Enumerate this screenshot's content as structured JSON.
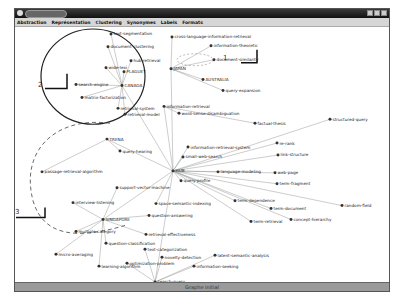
{
  "window": {
    "title": "",
    "controls": [
      "minimize",
      "maximize",
      "close"
    ]
  },
  "menu": {
    "items": [
      {
        "label": "Abstraction"
      },
      {
        "label": "Représentation"
      },
      {
        "label": "Clustering"
      },
      {
        "label": "Synonymes"
      },
      {
        "label": "Labels"
      },
      {
        "label": "Formats"
      }
    ]
  },
  "annotations": {
    "region1": "1",
    "region2": "2",
    "region3": "3"
  },
  "graph": {
    "nodes": [
      {
        "id": "text-segmentation",
        "x": 96,
        "y": 7
      },
      {
        "id": "document-clustering",
        "x": 93,
        "y": 20
      },
      {
        "id": "hub-retrieval",
        "x": 116,
        "y": 34
      },
      {
        "id": "cross-language-information-retrieval",
        "x": 157,
        "y": 10
      },
      {
        "id": "information-theoretic",
        "x": 196,
        "y": 19
      },
      {
        "id": "document-similarity",
        "x": 199,
        "y": 33
      },
      {
        "id": "JAPAN",
        "x": 156,
        "y": 42
      },
      {
        "id": "AUSTRALIA",
        "x": 188,
        "y": 53
      },
      {
        "id": "query-expansion",
        "x": 208,
        "y": 64
      },
      {
        "id": "wide-lexi",
        "x": 91,
        "y": 41
      },
      {
        "id": "PLAGUEY",
        "x": 109,
        "y": 45
      },
      {
        "id": "search-engine",
        "x": 61,
        "y": 58
      },
      {
        "id": "CANADA",
        "x": 107,
        "y": 59
      },
      {
        "id": "matrix-factorization",
        "x": 67,
        "y": 71
      },
      {
        "id": "retrieval-system",
        "x": 103,
        "y": 82
      },
      {
        "id": "retrieval-model",
        "x": 110,
        "y": 88
      },
      {
        "id": "information-retrieval",
        "x": 149,
        "y": 80
      },
      {
        "id": "word-sense-disambiguation",
        "x": 164,
        "y": 87
      },
      {
        "id": "factual-thesis",
        "x": 240,
        "y": 97
      },
      {
        "id": "structured-query",
        "x": 315,
        "y": 93
      },
      {
        "id": "TRENA",
        "x": 92,
        "y": 113
      },
      {
        "id": "query-hearing",
        "x": 105,
        "y": 125
      },
      {
        "id": "information-retrieval-system",
        "x": 173,
        "y": 121
      },
      {
        "id": "small-web-search",
        "x": 168,
        "y": 131
      },
      {
        "id": "re-rank",
        "x": 262,
        "y": 117
      },
      {
        "id": "link-structure",
        "x": 263,
        "y": 129
      },
      {
        "id": "passage-retrieval-algorithm",
        "x": 27,
        "y": 146
      },
      {
        "id": "HUB",
        "x": 158,
        "y": 145
      },
      {
        "id": "language-modeling",
        "x": 203,
        "y": 146
      },
      {
        "id": "query-profile",
        "x": 166,
        "y": 155
      },
      {
        "id": "web-page",
        "x": 260,
        "y": 147
      },
      {
        "id": "term-fragment",
        "x": 262,
        "y": 158
      },
      {
        "id": "support-vector-machine",
        "x": 102,
        "y": 162
      },
      {
        "id": "term-dependence",
        "x": 220,
        "y": 175
      },
      {
        "id": "term-document",
        "x": 256,
        "y": 183
      },
      {
        "id": "interview-listening",
        "x": 58,
        "y": 177
      },
      {
        "id": "space-semantic-indexing",
        "x": 141,
        "y": 178
      },
      {
        "id": "question-answering",
        "x": 134,
        "y": 190
      },
      {
        "id": "random-field",
        "x": 327,
        "y": 180
      },
      {
        "id": "concept-hierarchy",
        "x": 276,
        "y": 194
      },
      {
        "id": "SINGAPORE",
        "x": 88,
        "y": 194
      },
      {
        "id": "term-retrieval",
        "x": 236,
        "y": 196
      },
      {
        "id": "multiple-category",
        "x": 61,
        "y": 206
      },
      {
        "id": "question-classification",
        "x": 91,
        "y": 218
      },
      {
        "id": "retrieval-effectiveness",
        "x": 131,
        "y": 209
      },
      {
        "id": "micro-averaging",
        "x": 41,
        "y": 229
      },
      {
        "id": "text-categorization",
        "x": 130,
        "y": 224
      },
      {
        "id": "novelty-detection",
        "x": 147,
        "y": 232
      },
      {
        "id": "latent-semantic-analysis",
        "x": 200,
        "y": 230
      },
      {
        "id": "learning-algorithm",
        "x": 84,
        "y": 241
      },
      {
        "id": "information-seeking",
        "x": 179,
        "y": 241
      },
      {
        "id": "optimization-problem",
        "x": 112,
        "y": 238
      },
      {
        "id": "search-query",
        "x": 140,
        "y": 257
      },
      {
        "id": "recall-precision",
        "x": 106,
        "y": 268
      },
      {
        "id": "vector-space-model",
        "x": 192,
        "y": 267
      },
      {
        "id": "retrieval-performance",
        "x": 187,
        "y": 273
      },
      {
        "id": "digital-library",
        "x": 112,
        "y": 281
      },
      {
        "id": "resource-selection",
        "x": 161,
        "y": 282
      }
    ]
  },
  "status": {
    "text": "Graphe initial"
  }
}
